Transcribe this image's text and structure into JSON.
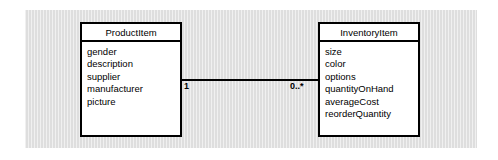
{
  "diagram": {
    "type": "uml-class-diagram",
    "background_color": "#dedede",
    "page_background": "#ffffff",
    "line_color": "#000000",
    "box_fill": "#ffffff",
    "classes": [
      {
        "id": "productitem",
        "name": "ProductItem",
        "attributes": [
          "gender",
          "description",
          "supplier",
          "manufacturer",
          "picture"
        ]
      },
      {
        "id": "inventoryitem",
        "name": "InventoryItem",
        "attributes": [
          "size",
          "color",
          "options",
          "quantityOnHand",
          "averageCost",
          "reorderQuantity"
        ]
      }
    ],
    "association": {
      "source_multiplicity": "1",
      "target_multiplicity": "0..*"
    }
  }
}
